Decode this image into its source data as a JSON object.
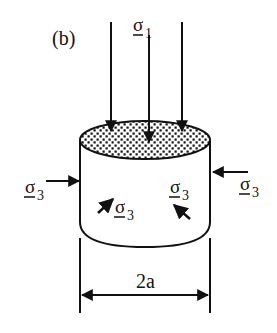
{
  "figure": {
    "panel_label": "(b)",
    "axial_stress": {
      "symbol": "σ",
      "subscript": "1"
    },
    "confining_stress_left": {
      "symbol": "σ",
      "subscript": "3"
    },
    "confining_stress_right": {
      "symbol": "σ",
      "subscript": "3"
    },
    "confining_stress_front_left": {
      "symbol": "σ",
      "subscript": "3"
    },
    "confining_stress_front_right": {
      "symbol": "σ",
      "subscript": "3"
    },
    "dimension_label": "2a",
    "colors": {
      "ink": "#111111",
      "background": "#ffffff"
    }
  }
}
